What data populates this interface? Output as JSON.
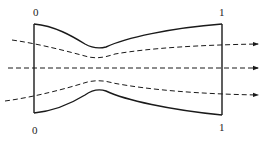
{
  "diagram": {
    "type": "nozzle-flow (converging-diverging channel with streamlines)",
    "labels": {
      "inlet_top": "0",
      "inlet_bottom": "0",
      "outlet_top": "1",
      "outlet_bottom": "1"
    },
    "walls": {
      "top": "M34,24 C55,26 72,36 85,44 C92,48 98,49 106,47 C125,38 170,28 222,24",
      "bottom": "M34,113 C55,111 72,103 85,95 C92,90 100,89 106,91 C125,100 170,110 222,115",
      "inlet": "M34,24 L34,113",
      "outlet": "M222,24 L222,115"
    },
    "streamlines": [
      {
        "name": "upper",
        "path": "M12,40 C40,44 70,52 85,56 C95,59 103,58 115,54 C150,48 200,45 258,44"
      },
      {
        "name": "center",
        "path": "M8,68 L258,68"
      },
      {
        "name": "lower",
        "path": "M5,101 C35,97 68,88 84,83 C93,80 103,80 113,83 C150,90 200,94 258,95"
      }
    ],
    "colors": {
      "stroke": "#1a1a1a",
      "background": "#ffffff"
    }
  }
}
